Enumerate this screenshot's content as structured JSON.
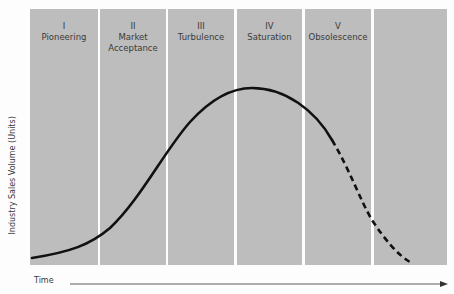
{
  "diagram": {
    "ylabel": "Industry Sales Volume (Units)",
    "xlabel": "Time",
    "stages": [
      {
        "numeral": "I",
        "name": "Pioneering"
      },
      {
        "numeral": "II",
        "name": "Market Acceptance"
      },
      {
        "numeral": "III",
        "name": "Turbulence"
      },
      {
        "numeral": "IV",
        "name": "Saturation"
      },
      {
        "numeral": "V",
        "name": "Obsolescence"
      },
      {
        "numeral": "",
        "name": ""
      }
    ],
    "colors": {
      "panel": "#bdbdbd",
      "curve": "#111111",
      "background": "#fdfdfd"
    }
  }
}
